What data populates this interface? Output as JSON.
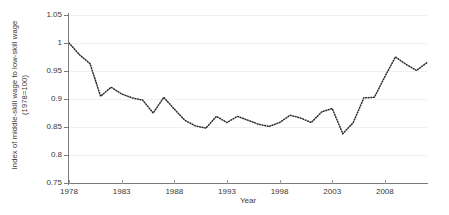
{
  "chart_data": {
    "type": "line",
    "title": "",
    "xlabel": "Year",
    "ylabel": "Index of middle-skill wage to low-skill wage (1978=100)",
    "ylabel_line1": "Index of middle-skill wage to low-skill wage",
    "ylabel_line2": "(1978=100)",
    "xlim": [
      1978,
      2012
    ],
    "ylim": [
      0.75,
      1.05
    ],
    "grid": true,
    "legend": "none",
    "line_style": "dotted",
    "line_color": "#2b2b2b",
    "ytick_labels": [
      "1.05",
      "1",
      "0.95",
      "0.9",
      "0.85",
      "0.8",
      "0.75"
    ],
    "ytick_values": [
      1.05,
      1.0,
      0.95,
      0.9,
      0.85,
      0.8,
      0.75
    ],
    "xtick_labels": [
      "1978",
      "1983",
      "1988",
      "1993",
      "1998",
      "2003",
      "2008"
    ],
    "xtick_values": [
      1978,
      1983,
      1988,
      1993,
      1998,
      2003,
      2008
    ],
    "x": [
      1978,
      1979,
      1980,
      1981,
      1982,
      1983,
      1984,
      1985,
      1986,
      1987,
      1988,
      1989,
      1990,
      1991,
      1992,
      1993,
      1994,
      1995,
      1996,
      1997,
      1998,
      1999,
      2000,
      2001,
      2002,
      2003,
      2004,
      2005,
      2006,
      2007,
      2008,
      2009,
      2010,
      2011,
      2012
    ],
    "values": [
      1.0,
      0.979,
      0.963,
      0.905,
      0.921,
      0.909,
      0.902,
      0.898,
      0.875,
      0.903,
      0.882,
      0.862,
      0.852,
      0.848,
      0.869,
      0.858,
      0.869,
      0.862,
      0.855,
      0.851,
      0.858,
      0.871,
      0.866,
      0.858,
      0.877,
      0.883,
      0.838,
      0.858,
      0.902,
      0.903,
      0.94,
      0.975,
      0.962,
      0.951,
      0.965
    ],
    "series": [
      {
        "name": "Index of middle-skill wage to low-skill wage",
        "values": [
          1.0,
          0.979,
          0.963,
          0.905,
          0.921,
          0.909,
          0.902,
          0.898,
          0.875,
          0.903,
          0.882,
          0.862,
          0.852,
          0.848,
          0.869,
          0.858,
          0.869,
          0.862,
          0.855,
          0.851,
          0.858,
          0.871,
          0.866,
          0.858,
          0.877,
          0.883,
          0.838,
          0.858,
          0.902,
          0.903,
          0.94,
          0.975,
          0.962,
          0.951,
          0.965
        ]
      }
    ]
  }
}
